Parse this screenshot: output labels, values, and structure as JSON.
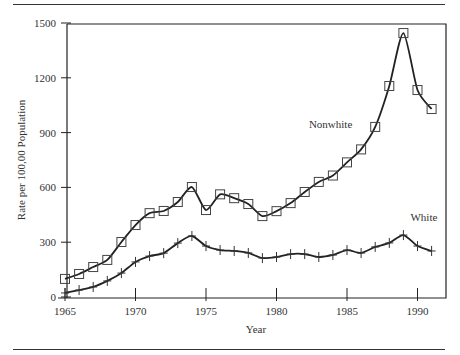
{
  "chart_data": {
    "type": "line",
    "title": "",
    "xlabel": "Year",
    "ylabel": "Rate per 100,00 Population",
    "xlim": [
      1965,
      1992
    ],
    "ylim": [
      0,
      1500
    ],
    "xticks": [
      1965,
      1970,
      1975,
      1980,
      1985,
      1990
    ],
    "yticks": [
      0,
      300,
      600,
      900,
      1200,
      1500
    ],
    "grid": false,
    "legend": "inline labels",
    "x": [
      1965,
      1966,
      1967,
      1968,
      1969,
      1970,
      1971,
      1972,
      1973,
      1974,
      1975,
      1976,
      1977,
      1978,
      1979,
      1980,
      1981,
      1982,
      1983,
      1984,
      1985,
      1986,
      1987,
      1988,
      1989,
      1990,
      1991
    ],
    "series": [
      {
        "name": "Nonwhite",
        "marker": "square",
        "values": [
          99,
          126,
          164,
          203,
          301,
          394,
          459,
          471,
          520,
          602,
          476,
          562,
          541,
          509,
          443,
          470,
          514,
          575,
          630,
          665,
          737,
          808,
          931,
          1155,
          1445,
          1133,
          1029
        ]
      },
      {
        "name": "White",
        "marker": "plus",
        "values": [
          22,
          38,
          55,
          88,
          131,
          192,
          224,
          240,
          295,
          334,
          279,
          257,
          252,
          241,
          213,
          219,
          235,
          235,
          219,
          230,
          257,
          241,
          274,
          296,
          339,
          279,
          252
        ]
      }
    ],
    "annotations": [
      {
        "text": "Nonwhite",
        "x": 1982.3,
        "y": 925
      },
      {
        "text": "White",
        "x": 1989.5,
        "y": 415
      }
    ]
  }
}
